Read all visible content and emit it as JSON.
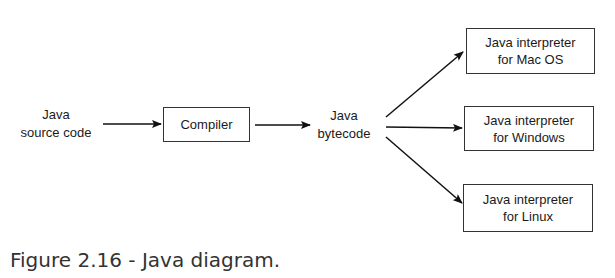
{
  "diagram": {
    "source": {
      "line1": "Java",
      "line2": "source code"
    },
    "compiler": {
      "label": "Compiler"
    },
    "bytecode": {
      "line1": "Java",
      "line2": "bytecode"
    },
    "interpreters": [
      {
        "line1": "Java interpreter",
        "line2": "for Mac OS"
      },
      {
        "line1": "Java interpreter",
        "line2": "for Windows"
      },
      {
        "line1": "Java interpreter",
        "line2": "for Linux"
      }
    ],
    "edges": [
      {
        "from": "source",
        "to": "compiler"
      },
      {
        "from": "compiler",
        "to": "bytecode"
      },
      {
        "from": "bytecode",
        "to": "interpreter-mac"
      },
      {
        "from": "bytecode",
        "to": "interpreter-windows"
      },
      {
        "from": "bytecode",
        "to": "interpreter-linux"
      }
    ]
  },
  "caption": "Figure 2.16 - Java diagram."
}
